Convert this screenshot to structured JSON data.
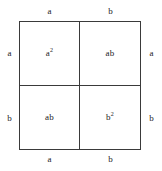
{
  "diagram": {
    "kind": "algebraic-area-model",
    "identity": "(a+b)^2 = a^2 + 2ab + b^2",
    "stroke_color": "#3a3a3a",
    "text_color": "#1c1c1c",
    "background_color": "#ffffff",
    "cells": [
      {
        "position": "top-left",
        "base": "a",
        "exponent": "2",
        "label": "a2"
      },
      {
        "position": "top-right",
        "base": "ab",
        "exponent": "",
        "label": "ab"
      },
      {
        "position": "bottom-left",
        "base": "ab",
        "exponent": "",
        "label": "ab"
      },
      {
        "position": "bottom-right",
        "base": "b",
        "exponent": "2",
        "label": "b2"
      }
    ],
    "edges": {
      "top": [
        {
          "label": "a"
        },
        {
          "label": "b"
        }
      ],
      "bottom": [
        {
          "label": "a"
        },
        {
          "label": "b"
        }
      ],
      "left": [
        {
          "label": "a"
        },
        {
          "label": "b"
        }
      ],
      "right": [
        {
          "label": "a"
        },
        {
          "label": "b"
        }
      ]
    }
  },
  "chart_data": {
    "type": "table",
    "title": "",
    "xlabel": "",
    "ylabel": "",
    "categories": [
      "a",
      "b"
    ],
    "row_labels": [
      "a",
      "b"
    ],
    "column_labels": [
      "a",
      "b"
    ],
    "cell_values": [
      [
        "a2",
        "ab"
      ],
      [
        "ab",
        "b2"
      ]
    ],
    "grid": true,
    "legend": "none"
  }
}
